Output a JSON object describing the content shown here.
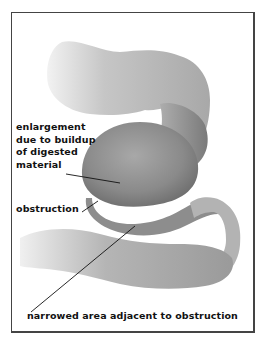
{
  "diagram": {
    "labels": {
      "enlargement": [
        "enlargement",
        "due to buildup",
        "of digested",
        "material"
      ],
      "obstruction": "obstruction",
      "narrowed": "narrowed area adjacent to obstruction"
    },
    "colors": {
      "border": "#444444",
      "text": "#111111",
      "tissue_light": "#c9c9c9",
      "tissue_mid": "#9a9a9a",
      "tissue_dark": "#6f6f6f"
    }
  }
}
